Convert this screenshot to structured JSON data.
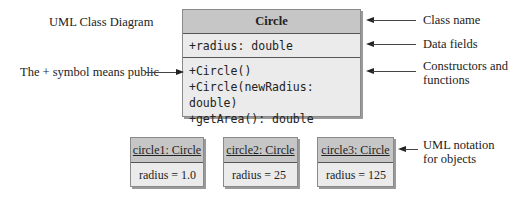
{
  "diagram": {
    "title": "UML Class Diagram",
    "class": {
      "name": "Circle",
      "fields": [
        "+radius: double"
      ],
      "methods": [
        "+Circle()",
        "+Circle(newRadius: double)",
        "+getArea(): double"
      ]
    },
    "objects": [
      {
        "header": "circle1: Circle",
        "value": "radius = 1.0"
      },
      {
        "header": "circle2: Circle",
        "value": "radius = 25"
      },
      {
        "header": "circle3: Circle",
        "value": "radius = 125"
      }
    ],
    "annotations": {
      "public_symbol": "The + symbol means public",
      "class_name": "Class name",
      "data_fields": "Data fields",
      "constructors_line1": "Constructors and",
      "constructors_line2": "functions",
      "objects_line1": "UML notation",
      "objects_line2": "for objects"
    }
  }
}
